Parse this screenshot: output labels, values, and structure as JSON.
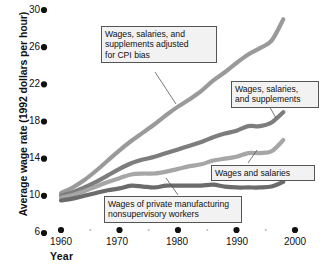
{
  "chart_data": {
    "type": "line",
    "title": "",
    "xlabel": "Year",
    "ylabel": "Average wage rate (1992 dollars per hour)",
    "xlim": [
      1959,
      2001
    ],
    "ylim": [
      6,
      30
    ],
    "grid": false,
    "legend_position": "inline-callouts",
    "ytick_labels": [
      "6",
      "10",
      "14",
      "18",
      "22",
      "26",
      "30"
    ],
    "ytick_values": [
      6,
      10,
      14,
      18,
      22,
      26,
      30
    ],
    "xtick_labels": [
      "1960",
      "1970",
      "1980",
      "1990",
      "2000"
    ],
    "xtick_values": [
      1960,
      1970,
      1980,
      1990,
      2000
    ],
    "xminor_values": [
      1965,
      1975,
      1985,
      1995
    ],
    "series": [
      {
        "name": "Wages, salaries, and supplements adjusted for CPI bias",
        "color": "#9a9a9a",
        "x": [
          1960,
          1962,
          1964,
          1966,
          1968,
          1970,
          1972,
          1974,
          1976,
          1978,
          1980,
          1982,
          1984,
          1986,
          1988,
          1990,
          1992,
          1994,
          1996,
          1998
        ],
        "values": [
          10.3,
          10.9,
          11.7,
          12.7,
          13.8,
          14.9,
          15.9,
          16.8,
          17.7,
          18.7,
          19.6,
          20.4,
          21.3,
          22.4,
          23.3,
          24.3,
          25.2,
          25.9,
          26.7,
          29.0
        ]
      },
      {
        "name": "Wages, salaries, and supplements",
        "color": "#7d7d7d",
        "x": [
          1960,
          1962,
          1964,
          1966,
          1968,
          1970,
          1972,
          1974,
          1976,
          1978,
          1980,
          1982,
          1984,
          1986,
          1988,
          1990,
          1992,
          1994,
          1996,
          1998
        ],
        "values": [
          10.0,
          10.4,
          10.9,
          11.5,
          12.2,
          12.9,
          13.5,
          13.9,
          14.2,
          14.6,
          15.0,
          15.4,
          15.8,
          16.3,
          16.7,
          17.0,
          17.5,
          17.5,
          17.9,
          19.0
        ]
      },
      {
        "name": "Wages and salaries",
        "color": "#a6a6a6",
        "x": [
          1960,
          1962,
          1964,
          1966,
          1968,
          1970,
          1972,
          1974,
          1976,
          1978,
          1980,
          1982,
          1984,
          1986,
          1988,
          1990,
          1992,
          1994,
          1996,
          1998
        ],
        "values": [
          9.8,
          10.1,
          10.5,
          11.0,
          11.5,
          11.9,
          12.3,
          12.4,
          12.4,
          12.6,
          12.9,
          13.2,
          13.4,
          13.8,
          14.0,
          14.2,
          14.6,
          14.6,
          14.8,
          16.0
        ]
      },
      {
        "name": "Wages of private manufacturing nonsupervisory workers",
        "color": "#6b6b6b",
        "x": [
          1960,
          1962,
          1964,
          1966,
          1968,
          1970,
          1972,
          1974,
          1976,
          1978,
          1980,
          1982,
          1984,
          1986,
          1988,
          1990,
          1992,
          1994,
          1996,
          1998
        ],
        "values": [
          9.5,
          9.7,
          10.0,
          10.3,
          10.6,
          10.8,
          11.1,
          11.0,
          10.9,
          11.1,
          11.1,
          11.1,
          11.1,
          11.2,
          11.0,
          10.9,
          10.9,
          10.9,
          11.0,
          11.5
        ]
      }
    ],
    "callouts": [
      {
        "id": "callout-cpi-adjusted",
        "text": "Wages, salaries, and\nsupplements adjusted\nfor CPI bias"
      },
      {
        "id": "callout-wages-supplements",
        "text": "Wages, salaries,\nand supplements"
      },
      {
        "id": "callout-wages-salaries",
        "text": "Wages and salaries"
      },
      {
        "id": "callout-manufacturing",
        "text": "Wages of private manufacturing\nnonsupervisory workers"
      }
    ]
  },
  "axes": {
    "y_title": "Average wage rate (1992 dollars per hour)",
    "x_title": "Year",
    "y_ticks": [
      "30",
      "26",
      "22",
      "18",
      "14",
      "10",
      "6"
    ],
    "x_ticks": [
      "1960",
      "1970",
      "1980",
      "1990",
      "2000"
    ]
  }
}
